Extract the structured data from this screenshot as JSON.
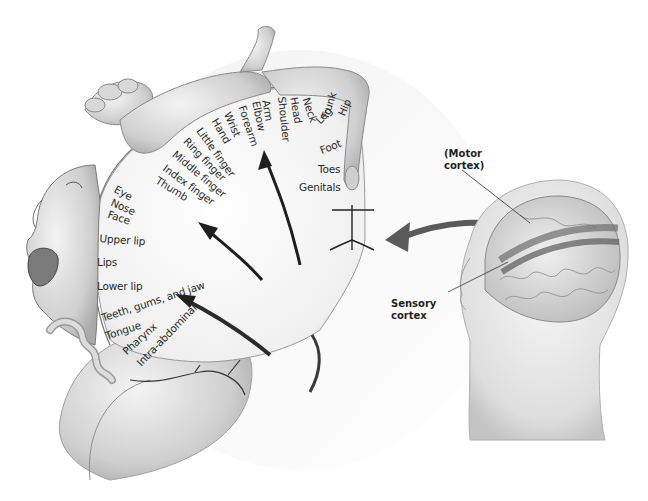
{
  "figure": {
    "colors": {
      "background": "#ffffff",
      "tissue": "#d9d9d9",
      "tissue_dark": "#8a8a8a",
      "ink": "#1f1f1f",
      "cortex_face": "#f2f2f2"
    }
  },
  "body_map": {
    "labels": [
      {
        "text": "Neck"
      },
      {
        "text": "Head"
      },
      {
        "text": "Shoulder"
      },
      {
        "text": "Arm"
      },
      {
        "text": "Elbow"
      },
      {
        "text": "Forearm"
      },
      {
        "text": "Wrist"
      },
      {
        "text": "Hand"
      },
      {
        "text": "Little finger"
      },
      {
        "text": "Ring finger"
      },
      {
        "text": "Middle finger"
      },
      {
        "text": "Index finger"
      },
      {
        "text": "Thumb"
      },
      {
        "text": "Eye"
      },
      {
        "text": "Nose"
      },
      {
        "text": "Face"
      },
      {
        "text": "Upper lip"
      },
      {
        "text": "Lips"
      },
      {
        "text": "Lower lip"
      },
      {
        "text": "Teeth, gums, and jaw"
      },
      {
        "text": "Tongue"
      },
      {
        "text": "Pharynx"
      },
      {
        "text": "Intra-abdominal"
      },
      {
        "text": "Trunk"
      },
      {
        "text": "Hip"
      },
      {
        "text": "Leg"
      },
      {
        "text": "Foot"
      },
      {
        "text": "Toes"
      },
      {
        "text": "Genitals"
      }
    ]
  },
  "inset": {
    "motor_label": "(Motor\ncortex)",
    "sensory_label": "Sensory\ncortex"
  }
}
